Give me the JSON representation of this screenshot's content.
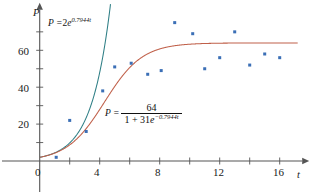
{
  "chart_data": {
    "type": "scatter",
    "title": "",
    "xlabel": "t",
    "ylabel": "P",
    "xlim": [
      0,
      17.5
    ],
    "ylim": [
      0,
      82
    ],
    "grid": false,
    "legend_position": "none",
    "x_ticks_major": [
      0,
      4,
      8,
      12,
      16
    ],
    "x_ticks_minor": [
      2,
      6,
      10,
      14
    ],
    "y_ticks_major": [
      20,
      40,
      60
    ],
    "y_ticks_minor": [
      10,
      30,
      50,
      70
    ],
    "x_tick_labels": [
      "0",
      "4",
      "8",
      "12",
      "16"
    ],
    "y_tick_labels": [
      "20",
      "40",
      "60"
    ],
    "scatter_color": "#3b6fb6",
    "series": [
      {
        "name": "data points",
        "type": "scatter",
        "color": "#3b6fb6",
        "x": [
          1.1,
          2.0,
          3.1,
          4.2,
          5.0,
          6.1,
          7.2,
          8.1,
          9.0,
          10.2,
          11.0,
          12.0,
          13.0,
          14.0,
          15.0,
          16.0
        ],
        "y": [
          2,
          22,
          16,
          38,
          51,
          53,
          47,
          49,
          75,
          69,
          50,
          56,
          70,
          52,
          58,
          56
        ]
      },
      {
        "name": "exponential model",
        "type": "line",
        "color": "#2f7f86",
        "equation_label": "P = 2e^{0.7944t}",
        "a": 2,
        "k": 0.7944
      },
      {
        "name": "logistic model",
        "type": "line",
        "color": "#c0604a",
        "equation_label": "P = 64 / (1 + 31e^{-0.7944t})",
        "carrying_capacity": 64,
        "a": 31,
        "k": 0.7944
      }
    ]
  },
  "labels": {
    "y_axis_symbol": "P",
    "x_axis_symbol": "t",
    "tick_0": "0",
    "tick_4": "4",
    "tick_8": "8",
    "tick_12": "12",
    "tick_16": "16",
    "tick_20": "20",
    "tick_40": "40",
    "tick_60": "60"
  },
  "annotations": {
    "exponential": {
      "lhs": "P =",
      "coefficient": "2",
      "base": "e",
      "exponent": "0.7944t"
    },
    "logistic": {
      "lhs": "P =",
      "numerator": "64",
      "denominator_prefix": "1 + 31",
      "denominator_base": "e",
      "denominator_exponent": "−0.7944t"
    }
  },
  "colors": {
    "axis": "#555555",
    "exponential_curve": "#2f7f86",
    "logistic_curve": "#c0604a",
    "points": "#3b6fb6",
    "text": "#111111",
    "background": "#ffffff"
  }
}
